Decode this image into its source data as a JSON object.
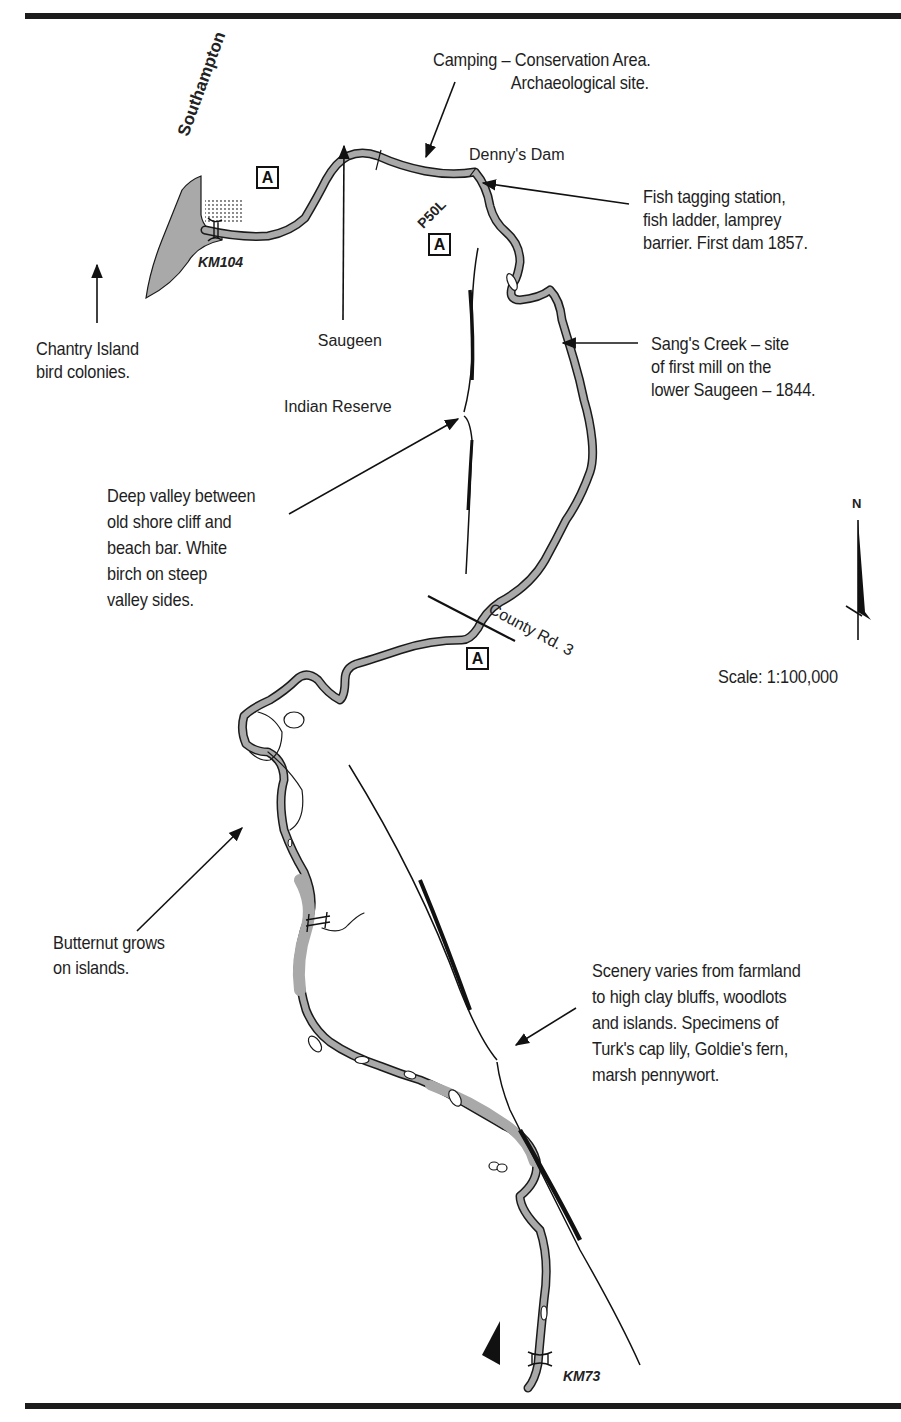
{
  "map": {
    "scale": "Scale: 1:100,000",
    "north_label": "N",
    "colors": {
      "river_fill": "#a9a9a9",
      "outline": "#1a1a1a",
      "paper": "#ffffff"
    },
    "places": {
      "southampton": "Southampton",
      "dennys_dam": "Denny's Dam",
      "saugeen_reserve_line1": "Saugeen",
      "saugeen_reserve_line2": "Indian Reserve",
      "county_road": "County Rd. 3",
      "km_start": "KM104",
      "km_end": "KM73",
      "portage": "P50L"
    },
    "access_points": [
      {
        "label": "A"
      },
      {
        "label": "A"
      },
      {
        "label": "A"
      }
    ],
    "annotations": {
      "camping": "Camping – Conservation Area.\n                  Archaeological site.",
      "fish": "Fish tagging station,\nfish ladder, lamprey\nbarrier. First dam 1857.",
      "chantry": "Chantry Island\nbird colonies.",
      "sangs": "Sang's Creek – site\nof first mill on the\nlower Saugeen – 1844.",
      "valley": "Deep valley between\nold shore cliff and\nbeach bar. White\nbirch on steep\nvalley sides.",
      "butternut": "Butternut grows\non islands.",
      "scenery": "Scenery varies from farmland\nto high clay bluffs, woodlots\nand islands. Specimens of\nTurk's cap lily, Goldie's fern,\nmarsh pennywort."
    },
    "icons": [
      "north-arrow-icon",
      "bridge-icon",
      "dam-icon",
      "access-point-icon",
      "direction-arrow-icon"
    ]
  }
}
